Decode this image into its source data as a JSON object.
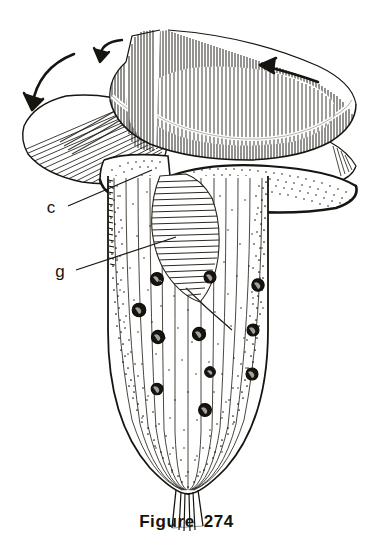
{
  "figure": {
    "caption_label": "Figure",
    "caption_number": "274",
    "caption_full": "Figure 274",
    "background_color": "#ffffff",
    "ink_color": "#17150f"
  },
  "labels": [
    {
      "id": "c",
      "text": "c",
      "meaning": "collar",
      "x": 55,
      "y": 211,
      "leader_to_x": 152,
      "leader_to_y": 170
    },
    {
      "id": "g",
      "text": "g",
      "meaning": "gullet",
      "x": 63,
      "y": 274,
      "leader_to_x": 176,
      "leader_to_y": 237
    }
  ],
  "arrows": [
    {
      "id": "arrow-top-left-outer",
      "direction": "curved-down-left",
      "note": "water current over outer collar"
    },
    {
      "id": "arrow-top-left-inner",
      "direction": "curved-down-right",
      "note": "water current into funnel"
    },
    {
      "id": "arrow-top-right",
      "direction": "left",
      "note": "water current along membranelle band"
    }
  ],
  "structures": [
    {
      "id": "membranelle-band",
      "name": "spiral membranelle band",
      "render": "dense vertical hatching"
    },
    {
      "id": "peristomial-collar",
      "name": "peristomial collar",
      "render": "radiating hatch lobes with thick dark rim"
    },
    {
      "id": "gullet",
      "name": "gullet / cytopharynx",
      "render": "elongate cross-hatched sac tapering downward"
    },
    {
      "id": "body",
      "name": "bell-shaped body",
      "render": "longitudinal striations with stippling"
    },
    {
      "id": "granules",
      "name": "granular inclusions",
      "count": 11,
      "render": "dark round blobs"
    },
    {
      "id": "stalk",
      "name": "basal stalk",
      "render": "short bundle of fibers"
    }
  ],
  "render_params": {
    "striation_count": 13,
    "band_hatch_count": 150,
    "stipple_density": "medium"
  }
}
